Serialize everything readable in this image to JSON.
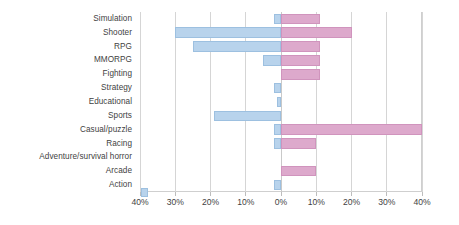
{
  "chart_data": {
    "type": "bar",
    "orientation": "horizontal-diverging",
    "title": "",
    "subtitle": "",
    "xlabel": "",
    "ylabel": "",
    "xlim": [
      -40,
      40
    ],
    "grid": true,
    "legend_position": "none",
    "tick_labels": [
      "40%",
      "30%",
      "20%",
      "10%",
      "0%",
      "10%",
      "20%",
      "30%",
      "40%"
    ],
    "tick_values": [
      -40,
      -30,
      -20,
      -10,
      0,
      10,
      20,
      30,
      40
    ],
    "colors": {
      "left_series": "#b8d3ec",
      "left_series_border": "#9dc0e0",
      "right_series": "#dda9cc",
      "right_series_border": "#d094bd",
      "gridline": "#d5d5d5",
      "text": "#3f3f3f",
      "background": "#ffffff"
    },
    "categories": [
      "Simulation",
      "Shooter",
      "RPG",
      "MMORPG",
      "Fighting",
      "Strategy",
      "Educational",
      "Sports",
      "Casual/puzzle",
      "Racing",
      "Adventure/survival horror",
      "Arcade",
      "Action"
    ],
    "series": [
      {
        "name": "left",
        "values": [
          2,
          30,
          25,
          5,
          0,
          2,
          1,
          19,
          2,
          2,
          0,
          0,
          2
        ]
      },
      {
        "name": "right",
        "values": [
          11,
          20,
          11,
          11,
          11,
          0,
          0,
          0,
          40,
          10,
          0,
          10,
          0
        ]
      }
    ]
  }
}
